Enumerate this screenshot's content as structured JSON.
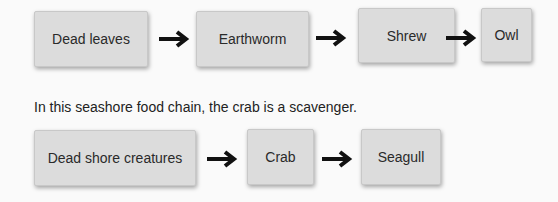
{
  "chain1": {
    "items": [
      {
        "label": "Dead leaves"
      },
      {
        "label": "Earthworm"
      },
      {
        "label": "Shrew"
      },
      {
        "label": "Owl"
      }
    ]
  },
  "caption": "In this seashore food chain, the crab is a scavenger.",
  "chain2": {
    "items": [
      {
        "label": "Dead shore creatures"
      },
      {
        "label": "Crab"
      },
      {
        "label": "Seagull"
      }
    ]
  },
  "icons": {
    "arrow": "arrow-right-icon"
  }
}
